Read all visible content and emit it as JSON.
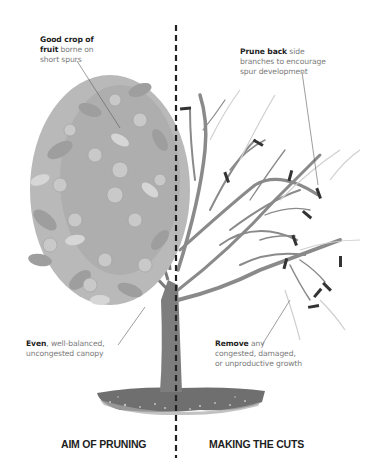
{
  "diagram": {
    "type": "illustration",
    "colors": {
      "background": "#ffffff",
      "canopy_leaf": "#9e9e9e",
      "canopy_leaf_light": "#c4c4c4",
      "fruit": "#b8b8b8",
      "branch": "#8a8a8a",
      "branch_light": "#cfcfcf",
      "trunk": "#7d7d7d",
      "soil": "#6f6f6f",
      "cut_mark": "#333333",
      "divider": "#222222",
      "heading_text": "#1e1e1e",
      "body_text": "#7a7a7a"
    }
  },
  "left_panel": {
    "heading": "AIM OF PRUNING",
    "callouts": [
      {
        "id": "fruit",
        "bold": "Good crop of fruit",
        "rest": "borne on short spurs",
        "line1_bold": "Good crop of",
        "line2_bold": "fruit",
        "line2_rest": " borne on",
        "line3": "short spurs"
      },
      {
        "id": "canopy",
        "bold": "Even",
        "rest": ", well-balanced, uncongested canopy",
        "line1_rest": ", well-balanced,",
        "line2": "uncongested canopy"
      }
    ]
  },
  "right_panel": {
    "heading": "MAKING THE CUTS",
    "callouts": [
      {
        "id": "prune",
        "bold": "Prune back",
        "rest": "side branches to encourage spur development",
        "line1_rest": " side",
        "line2": "branches to encourage",
        "line3": "spur development"
      },
      {
        "id": "remove",
        "bold": "Remove",
        "rest": "any congested, damaged, or unproductive growth",
        "line1_rest": " any",
        "line2": "congested, damaged,",
        "line3": "or unproductive growth"
      }
    ]
  }
}
